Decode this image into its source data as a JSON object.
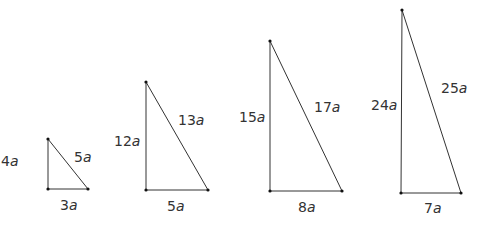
{
  "diagram": {
    "colors": {
      "line": "#333333",
      "vertex": "#111111",
      "text": "#333333",
      "background": "#ffffff"
    },
    "triangles": [
      {
        "id": "t1",
        "vertices": {
          "top": [
            48,
            139
          ],
          "bottom_left": [
            48,
            189
          ],
          "bottom_right": [
            88,
            189
          ]
        },
        "labels": {
          "vertical": {
            "num": "4",
            "var": "a",
            "x": 1,
            "y": 154
          },
          "hypotenuse": {
            "num": "5",
            "var": "a",
            "x": 74,
            "y": 150
          },
          "base": {
            "num": "3",
            "var": "a",
            "x": 60,
            "y": 198
          }
        }
      },
      {
        "id": "t2",
        "vertices": {
          "top": [
            146,
            82
          ],
          "bottom_left": [
            146,
            190
          ],
          "bottom_right": [
            208,
            190
          ]
        },
        "labels": {
          "vertical": {
            "num": "12",
            "var": "a",
            "x": 114,
            "y": 134
          },
          "hypotenuse": {
            "num": "13",
            "var": "a",
            "x": 178,
            "y": 113
          },
          "base": {
            "num": "5",
            "var": "a",
            "x": 167,
            "y": 199
          }
        }
      },
      {
        "id": "t3",
        "vertices": {
          "top": [
            270,
            41
          ],
          "bottom_left": [
            270,
            191
          ],
          "bottom_right": [
            342,
            191
          ]
        },
        "labels": {
          "vertical": {
            "num": "15",
            "var": "a",
            "x": 239,
            "y": 110
          },
          "hypotenuse": {
            "num": "17",
            "var": "a",
            "x": 314,
            "y": 100
          },
          "base": {
            "num": "8",
            "var": "a",
            "x": 298,
            "y": 200
          }
        }
      },
      {
        "id": "t4",
        "vertices": {
          "top": [
            402,
            10
          ],
          "bottom_left": [
            401,
            193
          ],
          "bottom_right": [
            461,
            193
          ]
        },
        "labels": {
          "vertical": {
            "num": "24",
            "var": "a",
            "x": 371,
            "y": 98
          },
          "hypotenuse": {
            "num": "25",
            "var": "a",
            "x": 441,
            "y": 81
          },
          "base": {
            "num": "7",
            "var": "a",
            "x": 424,
            "y": 201
          }
        }
      }
    ]
  }
}
